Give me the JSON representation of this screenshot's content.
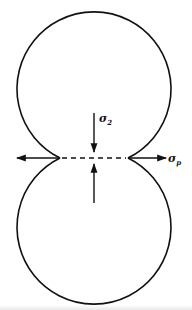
{
  "diagram": {
    "labels": {
      "sigma_2": {
        "main": "σ",
        "sub": "2"
      },
      "sigma_p": {
        "main": "σ",
        "sub": "p"
      }
    },
    "colors": {
      "stroke": "#111111",
      "background": "#ffffff"
    }
  }
}
